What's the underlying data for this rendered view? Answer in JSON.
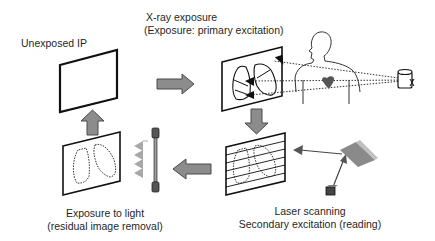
{
  "labels": {
    "unexposed": "Unexposed IP",
    "xray_line1": "X-ray exposure",
    "xray_line2": "(Exposure: primary excitation)",
    "laser_line1": "Laser scanning",
    "laser_line2": "Secondary excitation (reading)",
    "light_line1": "Exposure to light",
    "light_line2": "(residual image removal)"
  },
  "colors": {
    "arrow_fill": "#8c8c8c",
    "arrow_stroke": "#4a4a4a",
    "line": "#1a1a1a",
    "heart": "#555555",
    "mirror": "#8a8a8a",
    "background": "#ffffff"
  },
  "stages": [
    {
      "id": "unexposed",
      "name": "Unexposed IP"
    },
    {
      "id": "xray",
      "name": "X-ray exposure (Exposure: primary excitation)"
    },
    {
      "id": "laser",
      "name": "Laser scanning / Secondary excitation (reading)"
    },
    {
      "id": "erase",
      "name": "Exposure to light (residual image removal)"
    }
  ]
}
